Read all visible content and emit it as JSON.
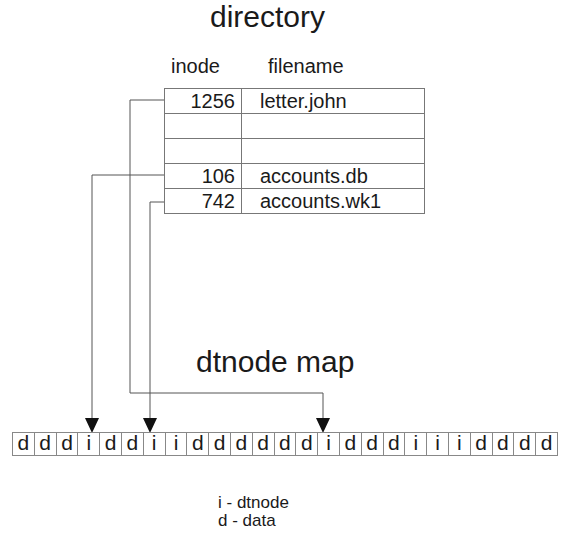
{
  "directory": {
    "title": "directory",
    "columns": {
      "inode": "inode",
      "filename": "filename"
    },
    "rows": [
      {
        "inode": "1256",
        "filename": "letter.john"
      },
      {
        "inode": "",
        "filename": ""
      },
      {
        "inode": "",
        "filename": ""
      },
      {
        "inode": "106",
        "filename": "accounts.db"
      },
      {
        "inode": "742",
        "filename": "accounts.wk1"
      }
    ]
  },
  "map": {
    "title": "dtnode map",
    "cells": [
      "d",
      "d",
      "d",
      "i",
      "d",
      "d",
      "i",
      "i",
      "d",
      "d",
      "d",
      "d",
      "d",
      "d",
      "i",
      "d",
      "d",
      "d",
      "i",
      "i",
      "i",
      "d",
      "d",
      "d",
      "d"
    ]
  },
  "pointers": [
    {
      "from_inode": "1256",
      "to_cell_index": 14
    },
    {
      "from_inode": "106",
      "to_cell_index": 3
    },
    {
      "from_inode": "742",
      "to_cell_index": 6
    }
  ],
  "legend": {
    "i": "i - dtnode",
    "d": "d - data"
  }
}
